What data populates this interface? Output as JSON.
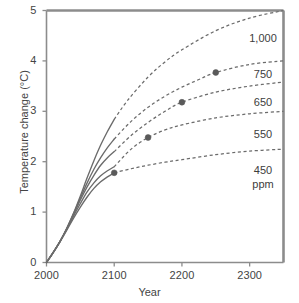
{
  "chart_data": {
    "type": "line",
    "title": "",
    "xlabel": "Year",
    "ylabel": "Temperature change (°C)",
    "xlim": [
      2000,
      2350
    ],
    "ylim": [
      0,
      5
    ],
    "xticks": [
      "2000",
      "2100",
      "2200",
      "2300"
    ],
    "xtick_values": [
      2000,
      2100,
      2200,
      2300
    ],
    "yticks": [
      "0",
      "1",
      "2",
      "3",
      "4",
      "5"
    ],
    "ytick_values": [
      0,
      1,
      2,
      3,
      4,
      5
    ],
    "grid": false,
    "legend_position": "right-inline-labels",
    "line_style_note": "solid through ~2100 then dotted/dashed beyond",
    "marker_note": "filled circle marks end of solid (emissions-stabilization) portion",
    "series": [
      {
        "name": "1,000",
        "label": "1,000",
        "label_sub": "",
        "color": "#6b6b6b",
        "x": [
          2000,
          2010,
          2020,
          2030,
          2040,
          2050,
          2060,
          2070,
          2080,
          2090,
          2100,
          2120,
          2150,
          2175,
          2200,
          2250,
          2300,
          2350
        ],
        "y": [
          0.0,
          0.2,
          0.42,
          0.68,
          0.98,
          1.32,
          1.68,
          2.02,
          2.33,
          2.6,
          2.84,
          3.22,
          3.68,
          3.98,
          4.22,
          4.6,
          4.85,
          5.0
        ],
        "solid_until": 2100,
        "marker": null
      },
      {
        "name": "750",
        "label": "750",
        "label_sub": "",
        "color": "#6b6b6b",
        "x": [
          2000,
          2010,
          2020,
          2030,
          2040,
          2050,
          2060,
          2070,
          2080,
          2090,
          2100,
          2125,
          2150,
          2175,
          2200,
          2225,
          2250,
          2300,
          2350
        ],
        "y": [
          0.0,
          0.2,
          0.42,
          0.68,
          0.97,
          1.28,
          1.58,
          1.85,
          2.08,
          2.28,
          2.45,
          2.8,
          3.08,
          3.3,
          3.48,
          3.63,
          3.77,
          3.93,
          4.0
        ],
        "solid_until": 2100,
        "marker": {
          "x": 2250,
          "y": 3.77
        }
      },
      {
        "name": "650",
        "label": "650",
        "label_sub": "",
        "color": "#6b6b6b",
        "x": [
          2000,
          2010,
          2020,
          2030,
          2040,
          2050,
          2060,
          2070,
          2080,
          2090,
          2100,
          2125,
          2150,
          2175,
          2200,
          2250,
          2300,
          2350
        ],
        "y": [
          0.0,
          0.2,
          0.42,
          0.67,
          0.95,
          1.24,
          1.5,
          1.73,
          1.93,
          2.08,
          2.2,
          2.52,
          2.78,
          3.0,
          3.18,
          3.38,
          3.5,
          3.58
        ],
        "solid_until": 2100,
        "marker": {
          "x": 2200,
          "y": 3.18
        }
      },
      {
        "name": "550",
        "label": "550",
        "label_sub": "",
        "color": "#6b6b6b",
        "x": [
          2000,
          2010,
          2020,
          2030,
          2040,
          2050,
          2060,
          2070,
          2080,
          2090,
          2100,
          2125,
          2150,
          2175,
          2200,
          2250,
          2300,
          2350
        ],
        "y": [
          0.0,
          0.2,
          0.42,
          0.66,
          0.92,
          1.17,
          1.4,
          1.58,
          1.72,
          1.82,
          1.9,
          2.25,
          2.48,
          2.63,
          2.73,
          2.87,
          2.95,
          3.0
        ],
        "solid_until": 2100,
        "marker": {
          "x": 2150,
          "y": 2.48
        }
      },
      {
        "name": "450",
        "label": "450",
        "label_sub": "ppm",
        "color": "#6b6b6b",
        "x": [
          2000,
          2010,
          2020,
          2030,
          2040,
          2050,
          2060,
          2070,
          2080,
          2090,
          2100,
          2125,
          2150,
          2175,
          2200,
          2250,
          2300,
          2350
        ],
        "y": [
          0.0,
          0.2,
          0.41,
          0.64,
          0.88,
          1.1,
          1.3,
          1.47,
          1.6,
          1.7,
          1.78,
          1.86,
          1.93,
          1.99,
          2.04,
          2.14,
          2.21,
          2.25
        ],
        "solid_until": 2100,
        "marker": {
          "x": 2100,
          "y": 1.78
        }
      }
    ],
    "series_labels": [
      {
        "text": "1,000",
        "sub": "",
        "x_px": 263,
        "y_px": 31
      },
      {
        "text": "750",
        "sub": "",
        "x_px": 263,
        "y_px": 67
      },
      {
        "text": "650",
        "sub": "",
        "x_px": 263,
        "y_px": 95
      },
      {
        "text": "550",
        "sub": "",
        "x_px": 263,
        "y_px": 127
      },
      {
        "text": "450",
        "sub": "ppm",
        "x_px": 263,
        "y_px": 163
      }
    ],
    "colors": {
      "line": "#6b6b6b",
      "axis": "#8c8c8c",
      "marker": "#5a5a5a",
      "text": "#3f3f3f",
      "background": "#ffffff"
    }
  }
}
